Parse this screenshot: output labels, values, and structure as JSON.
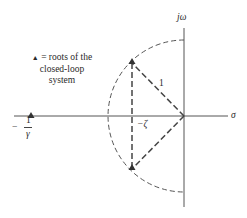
{
  "diagram": {
    "axes": {
      "imag_label": "jω",
      "real_label": "σ"
    },
    "legend": {
      "symbol": "▲",
      "text": "= roots of the closed-loop system"
    },
    "labels": {
      "radius": "1",
      "zeta": "−ζ",
      "pole_minus": "−",
      "pole_num": "1",
      "pole_den": "γ"
    },
    "colors": {
      "line": "#444444",
      "dashed": "#555555"
    }
  }
}
